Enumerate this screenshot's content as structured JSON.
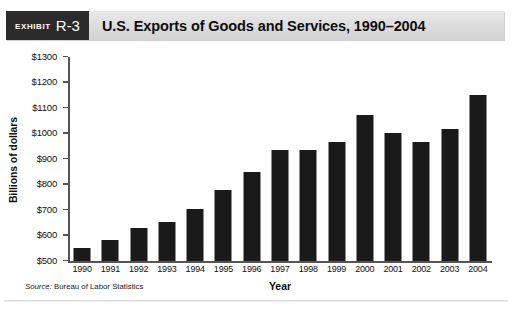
{
  "header": {
    "exhibit_word": "Exhibit",
    "exhibit_number": "R-3",
    "title": "U.S. Exports of Goods and Services, 1990–2004"
  },
  "source": {
    "label": "Source:",
    "text": " Bureau of Labor Statistics"
  },
  "chart_data": {
    "type": "bar",
    "title": "U.S. Exports of Goods and Services, 1990–2004",
    "xlabel": "Year",
    "ylabel": "Billions of dollars",
    "categories": [
      "1990",
      "1991",
      "1992",
      "1993",
      "1994",
      "1995",
      "1996",
      "1997",
      "1998",
      "1999",
      "2000",
      "2001",
      "2002",
      "2003",
      "2004"
    ],
    "values": [
      552,
      581,
      630,
      652,
      705,
      777,
      850,
      937,
      934,
      966,
      1071,
      1003,
      966,
      1017,
      1151
    ],
    "ylim": [
      500,
      1300
    ],
    "ytick_values": [
      500,
      600,
      700,
      800,
      900,
      1000,
      1100,
      1200,
      1300
    ],
    "ytick_labels": [
      "$500",
      "$600",
      "$700",
      "$800",
      "$900",
      "$1000",
      "$1100",
      "$1200",
      "$1300"
    ],
    "grid": false,
    "legend": null,
    "bar_color": "#1a1a1a",
    "axis_color": "#555555"
  }
}
